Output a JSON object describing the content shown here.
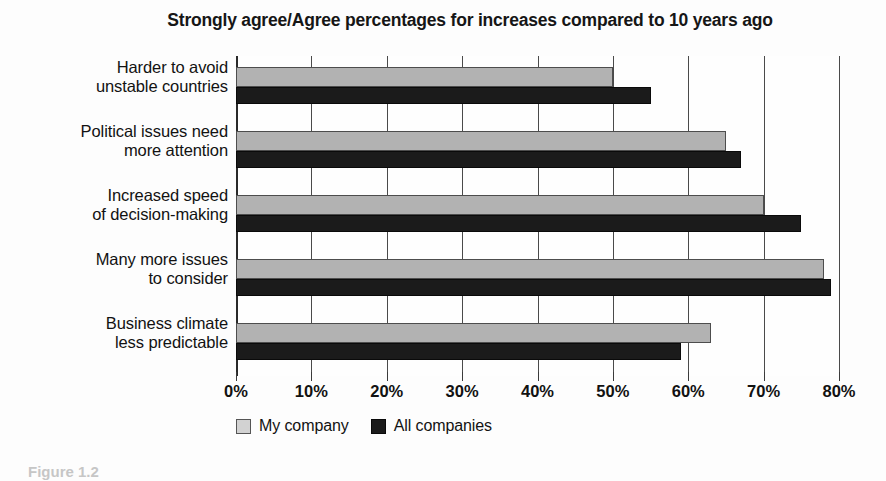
{
  "chart_data": {
    "type": "bar",
    "orientation": "horizontal",
    "title": "Strongly agree/Agree percentages for increases compared to 10 years ago",
    "xlabel": "",
    "ylabel": "",
    "xlim": [
      0,
      80
    ],
    "xtick_labels": [
      "0%",
      "10%",
      "20%",
      "30%",
      "40%",
      "50%",
      "60%",
      "70%",
      "80%"
    ],
    "xtick_values": [
      0,
      10,
      20,
      30,
      40,
      50,
      60,
      70,
      80
    ],
    "grid": true,
    "legend_position": "bottom-left",
    "categories": [
      "Harder to avoid unstable countries",
      "Political issues need more attention",
      "Increased speed of decision-making",
      "Many more issues to consider",
      "Business climate less predictable"
    ],
    "category_lines": [
      [
        "Harder to avoid",
        "unstable countries"
      ],
      [
        "Political issues need",
        "more attention"
      ],
      [
        "Increased speed",
        "of decision-making"
      ],
      [
        "Many more issues",
        "to consider"
      ],
      [
        "Business climate",
        "less predictable"
      ]
    ],
    "series": [
      {
        "name": "My company",
        "color": "#b2b2b2",
        "values": [
          50,
          65,
          70,
          78,
          63
        ]
      },
      {
        "name": "All companies",
        "color": "#1b1b1b",
        "values": [
          55,
          67,
          75,
          79,
          59
        ]
      }
    ]
  },
  "legend": {
    "items": [
      {
        "label": "My company",
        "swatch": "mine"
      },
      {
        "label": "All companies",
        "swatch": "all"
      }
    ]
  },
  "caption": {
    "text": "Figure 1.2"
  },
  "colors": {
    "series_my_company": "#b2b2b2",
    "series_all_companies": "#1b1b1b",
    "gridline": "#4a4a4a",
    "text": "#121212",
    "background": "#fdfdfd"
  }
}
